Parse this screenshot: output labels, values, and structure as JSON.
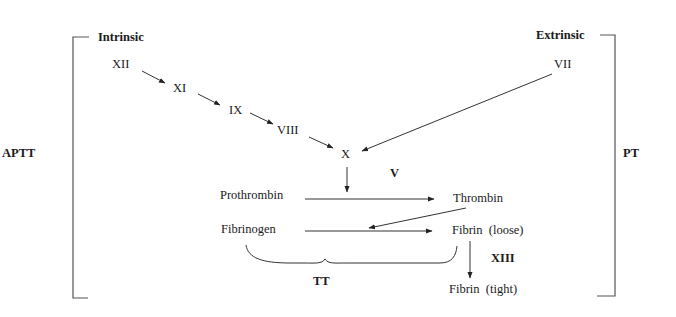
{
  "pathways": {
    "intrinsic": "Intrinsic",
    "extrinsic": "Extrinsic"
  },
  "tests": {
    "aptt": "APTT",
    "pt": "PT",
    "tt": "TT"
  },
  "factors": {
    "xii": "XII",
    "xi": "XI",
    "ix": "IX",
    "viii": "VIII",
    "vii": "VII",
    "x": "X",
    "v": "V",
    "xiii": "XIII"
  },
  "substances": {
    "prothrombin": "Prothrombin",
    "thrombin": "Thrombin",
    "fibrinogen": "Fibrinogen",
    "fibrin_loose": "Fibrin  (loose)",
    "fibrin_tight": "Fibrin  (tight)"
  },
  "colors": {
    "text": "#1a1a1a",
    "lines": "#333333",
    "background": "#ffffff"
  }
}
